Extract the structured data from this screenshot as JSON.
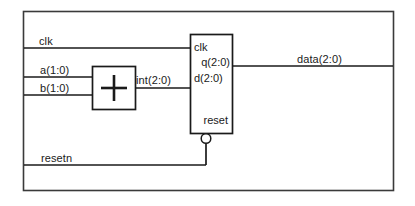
{
  "diagram": {
    "background_color": "#ffffff",
    "line_color": "#1a1a1a"
  },
  "signals": {
    "clk": "clk",
    "a": "a(1:0)",
    "b": "b(1:0)",
    "int": "int(2:0)",
    "data": "data(2:0)",
    "resetn": "resetn"
  },
  "adder": {
    "symbol": "+"
  },
  "register": {
    "ports": {
      "clk": "clk",
      "q": "q(2:0)",
      "d": "d(2:0)",
      "reset": "reset"
    }
  }
}
